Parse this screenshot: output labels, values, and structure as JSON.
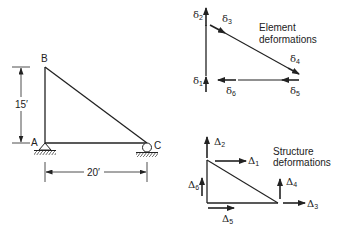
{
  "frame": {
    "joints": {
      "A": "A",
      "B": "B",
      "C": "C"
    },
    "height_dim": "15′",
    "width_dim": "20′",
    "supports": {
      "A": "pin",
      "C": "roller"
    }
  },
  "element_deformations": {
    "caption_line1": "Element",
    "caption_line2": "deformations",
    "symbol": "δ",
    "labels": {
      "d1": "1",
      "d2": "2",
      "d3": "3",
      "d4": "4",
      "d5": "5",
      "d6": "6"
    }
  },
  "structure_deformations": {
    "caption_line1": "Structure",
    "caption_line2": "deformations",
    "symbol": "Δ",
    "labels": {
      "D1": "1",
      "D2": "2",
      "D3": "3",
      "D4": "4",
      "D5": "5",
      "D6": "6"
    }
  },
  "colors": {
    "line": "#222222",
    "background": "#ffffff"
  }
}
